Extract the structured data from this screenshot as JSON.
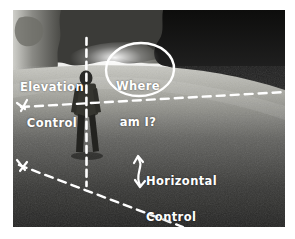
{
  "image": {
    "kind": "annotated-photograph",
    "alt_description": "Black and white photo of a person standing in a park lawn with hand-drawn white annotation lines and text",
    "width": 295,
    "height": 239,
    "photo_frame": {
      "left": 13,
      "top": 10,
      "width": 272,
      "height": 217
    },
    "page_background": "#ffffff"
  },
  "annotations": {
    "elevation": {
      "line1": "Elevation",
      "line2": "Control",
      "color": "#ffffff"
    },
    "horizontal": {
      "line1": "Horizontal",
      "line2": "Control",
      "color": "#ffffff"
    },
    "question": {
      "line1": "Where",
      "line2": "am I?",
      "color": "#ffffff"
    }
  },
  "graphics": {
    "dashed_line_color": "#ffffff",
    "circle_color": "#ffffff",
    "vertical_axis_name": "elevation-axis",
    "upper_diagonal_name": "elevation-diagonal",
    "lower_diagonal_name": "horizontal-diagonal",
    "curved_arrow_name": "horizontal-double-arrow"
  },
  "scene": {
    "subject": "standing-person-silhouette",
    "sky_tone": "#f2f2f0",
    "lawn_tone_near": "#2e2e2c",
    "lawn_tone_far": "#b9b9b4",
    "tree_tone": "#1b1b19"
  }
}
